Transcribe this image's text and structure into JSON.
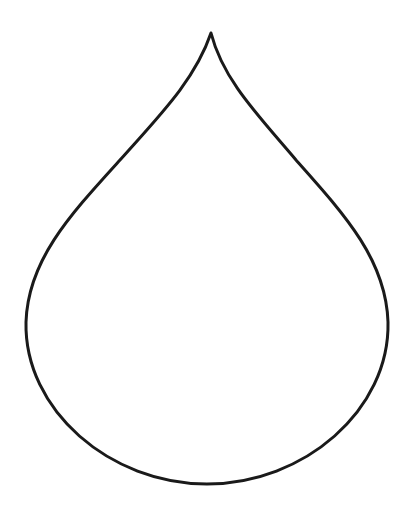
{
  "figure": {
    "description": "Teardrop outline",
    "shape": "teardrop",
    "stroke_color": "#1a1a1a",
    "fill_color": "#ffffff",
    "background": "#ffffff",
    "stroke_width": 3
  }
}
